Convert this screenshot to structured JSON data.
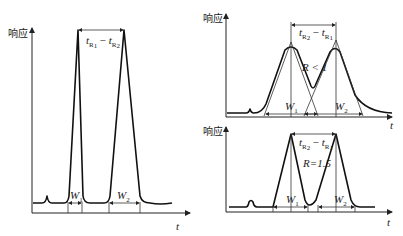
{
  "panels": {
    "left": {
      "y_axis_label": "响应",
      "x_axis_label": "t",
      "spacing_label": {
        "t1": "t",
        "s1": "R",
        "n1": "1",
        "op": "−",
        "t2": "t",
        "s2": "R",
        "n2": "2"
      },
      "w1": {
        "main": "W",
        "sub": "1"
      },
      "w2": {
        "main": "W",
        "sub": "2"
      }
    },
    "right_top": {
      "y_axis_label": "响应",
      "x_axis_label": "t",
      "spacing_label": {
        "t1": "t",
        "s1": "R",
        "n1": "2",
        "op": "−",
        "t2": "t",
        "s2": "R",
        "n2": "1"
      },
      "resolution_label": "R < 1",
      "w1": {
        "main": "W",
        "sub": "1"
      },
      "w2": {
        "main": "W",
        "sub": "2"
      }
    },
    "right_bottom": {
      "y_axis_label": "响应",
      "x_axis_label": "t",
      "spacing_label": {
        "t1": "t",
        "s1": "R",
        "n1": "2",
        "op": "−",
        "t2": "t",
        "s2": "R",
        "n2": "1"
      },
      "resolution_label": "R=1.5",
      "w1": {
        "main": "W",
        "sub": "1"
      },
      "w2": {
        "main": "W",
        "sub": "2"
      }
    }
  }
}
